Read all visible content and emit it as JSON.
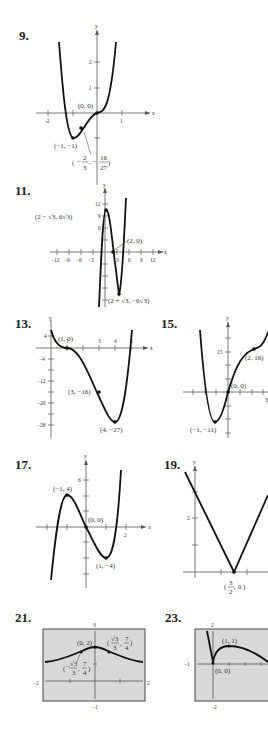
{
  "problems": [
    {
      "number": "9.",
      "axis_x": "x",
      "axis_y": "y",
      "ticks_x": [
        "-2",
        "1"
      ],
      "ticks_y": [
        "1",
        "2"
      ],
      "points": [
        "(0, 0)",
        "(−1, −1)"
      ],
      "frac_point": {
        "open": "(",
        "minus": "−",
        "n1": "2",
        "d1": "3",
        "n2": "16",
        "d2": "27"
      }
    },
    {
      "number": "11.",
      "axis_x": "x",
      "axis_y": "y",
      "ticks_x": [
        "−12",
        "−9",
        "−6",
        "−3",
        "3",
        "6",
        "9",
        "12"
      ],
      "ticks_y": [
        "12",
        "9",
        "6"
      ],
      "points": [
        "(2 − √3, 6√3)",
        "(2, 0)",
        "(2 + √3, −6√3)"
      ]
    },
    {
      "number": "13.",
      "axis_x": "x",
      "axis_y": "y",
      "ticks_x": [
        "1",
        "3",
        "4",
        "5"
      ],
      "ticks_y": [
        "4",
        "−4",
        "−12",
        "−20",
        "−28"
      ],
      "points": [
        "(1, 0)",
        "(3, −16)",
        "(4, −27)"
      ]
    },
    {
      "number": "15.",
      "axis_x": "x",
      "axis_y": "y",
      "ticks_x": [
        "3"
      ],
      "ticks_y": [
        "15"
      ],
      "points": [
        "(2, 16)",
        "(0, 0)",
        "(−1, −11)"
      ]
    },
    {
      "number": "17.",
      "axis_x": "x",
      "axis_y": "y",
      "ticks_x": [
        "2"
      ],
      "ticks_y": [
        "6"
      ],
      "points": [
        "(−1, 4)",
        "(0, 0)",
        "(1, −4)"
      ]
    },
    {
      "number": "19.",
      "axis_x": "x",
      "axis_y": "y",
      "ticks_x": [],
      "ticks_y": [
        "2"
      ],
      "points": [],
      "frac_point": {
        "n": "3",
        "d": "2",
        "y": "0"
      }
    },
    {
      "number": "21.",
      "window": {
        "xmin": "−2",
        "xmax": "2",
        "ymin": "−1",
        "ymax": "3"
      },
      "points": [
        "(0, 2)"
      ],
      "frac_points": [
        {
          "sign": "",
          "num": "√3",
          "den": "3",
          "y_num": "7",
          "y_den": "4"
        },
        {
          "sign": "−",
          "num": "√3",
          "den": "3",
          "y_num": "7",
          "y_den": "4"
        }
      ]
    },
    {
      "number": "23.",
      "window": {
        "xmin": "−1",
        "ymax": "2",
        "ymin": "−2"
      },
      "points": [
        "(1, 1)",
        "(0, 0)"
      ]
    }
  ]
}
